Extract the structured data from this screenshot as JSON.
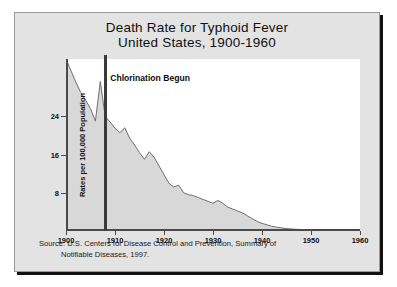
{
  "poster": {
    "title_line1": "Death Rate for Typhoid Fever",
    "title_line2": "United States, 1900-1960",
    "source_line1": "Source: U.S. Centers for Disease Control and Prevention, Summary of",
    "source_line2": "Notifiable Diseases, 1997.",
    "background_color": "#e3e3e3",
    "frame_color": "#9a9a9a"
  },
  "chart_data": {
    "type": "area",
    "title": "Death Rate for Typhoid Fever United States, 1900-1960",
    "xlabel": "",
    "ylabel": "Rates per 100,000 Population",
    "xlim": [
      1900,
      1960
    ],
    "ylim": [
      0,
      36
    ],
    "yticks": [
      8,
      16,
      24
    ],
    "ytick_labels": [
      "8",
      "16",
      "24"
    ],
    "xticks": [
      1900,
      1910,
      1920,
      1930,
      1940,
      1950,
      1960
    ],
    "xtick_labels": [
      "1900",
      "1910",
      "1920",
      "1930",
      "1940",
      "1950",
      "1960"
    ],
    "grid": false,
    "legend": null,
    "fill_color": "#d8d8d8",
    "line_color": "#6e6e6e",
    "annotations": [
      {
        "label": "Chlorination Begun",
        "x": 1908,
        "marker": "vertical-line",
        "color": "#3a3a3a"
      }
    ],
    "x": [
      1900,
      1901,
      1902,
      1903,
      1904,
      1905,
      1906,
      1907,
      1908,
      1909,
      1910,
      1911,
      1912,
      1913,
      1914,
      1915,
      1916,
      1917,
      1918,
      1919,
      1920,
      1921,
      1922,
      1923,
      1924,
      1925,
      1926,
      1927,
      1928,
      1929,
      1930,
      1931,
      1932,
      1933,
      1934,
      1935,
      1936,
      1937,
      1938,
      1939,
      1940,
      1941,
      1942,
      1943,
      1944,
      1945,
      1946,
      1947,
      1948,
      1949,
      1950,
      1951,
      1952,
      1953,
      1954,
      1955,
      1956,
      1957,
      1958,
      1959,
      1960
    ],
    "values": [
      36.0,
      33.6,
      31.2,
      29.0,
      27.4,
      25.6,
      23.0,
      31.3,
      24.0,
      22.8,
      21.5,
      20.6,
      21.6,
      19.4,
      18.0,
      16.4,
      15.0,
      16.6,
      15.4,
      13.6,
      11.8,
      10.0,
      9.2,
      9.6,
      8.0,
      7.6,
      7.4,
      7.0,
      6.6,
      6.2,
      5.8,
      6.4,
      5.8,
      5.0,
      4.6,
      4.2,
      3.8,
      3.2,
      2.6,
      2.0,
      1.6,
      1.3,
      1.0,
      0.8,
      0.65,
      0.5,
      0.42,
      0.35,
      0.3,
      0.26,
      0.22,
      0.2,
      0.18,
      0.16,
      0.14,
      0.12,
      0.11,
      0.1,
      0.09,
      0.08,
      0.07
    ]
  }
}
